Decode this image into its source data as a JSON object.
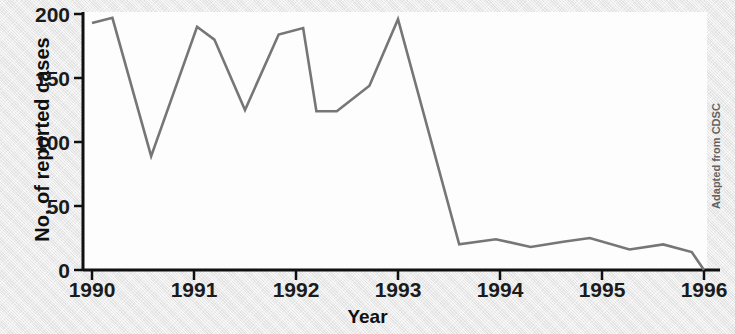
{
  "figure": {
    "credit": "Adapted from CDSC",
    "background_color": "#e9e9e9",
    "plot_background_color": "#fdfdfd",
    "axis_color": "#101010",
    "line_color": "#767676"
  },
  "chart_data": {
    "type": "line",
    "title": "",
    "subtitle": "",
    "xlabel": "Year",
    "ylabel": "No. of reported cases",
    "xlim": [
      1990,
      1996
    ],
    "ylim": [
      0,
      200
    ],
    "grid": false,
    "legend": null,
    "x_tick_labels": [
      "1990",
      "1991",
      "1992",
      "1993",
      "1994",
      "1995",
      "1996"
    ],
    "x_ticks": [
      1990,
      1991,
      1992,
      1993,
      1994,
      1995,
      1996
    ],
    "y_tick_labels": [
      "0",
      "50",
      "100",
      "150",
      "200"
    ],
    "y_ticks": [
      0,
      50,
      100,
      150,
      200
    ],
    "annotations": [
      "Adapted from CDSC"
    ],
    "series": [
      {
        "name": "No. of reported cases",
        "color": "#767676",
        "x": [
          1990.0,
          1990.2,
          1990.58,
          1991.03,
          1991.2,
          1991.5,
          1991.83,
          1992.07,
          1992.2,
          1992.4,
          1992.72,
          1993.0,
          1993.6,
          1993.96,
          1994.3,
          1994.62,
          1994.88,
          1995.27,
          1995.6,
          1995.88,
          1996.0
        ],
        "values": [
          193,
          197,
          89,
          190,
          180,
          125,
          184,
          189,
          124,
          124,
          144,
          196,
          20,
          24,
          18,
          22,
          25,
          16,
          20,
          14,
          0
        ]
      }
    ]
  }
}
